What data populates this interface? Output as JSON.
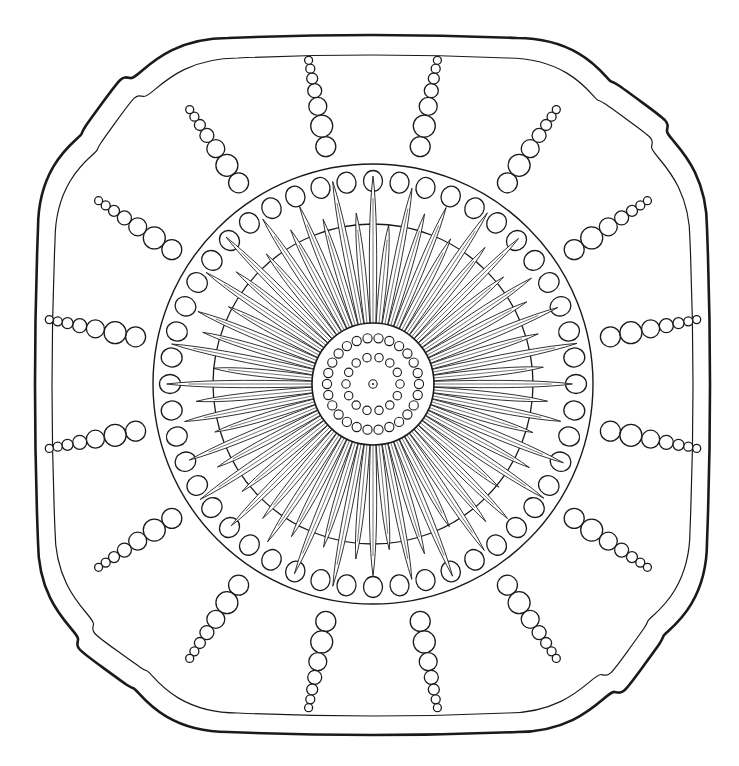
{
  "figure": {
    "title": "Decorative square dish with sunburst rosette and beaded rays"
  },
  "colors": {
    "background": "#ffffff",
    "ink": "#1a1a1a"
  },
  "canvas": {
    "width": 739,
    "height": 766
  },
  "center": {
    "x": 373,
    "y": 384
  },
  "plate": {
    "outer_rim": {
      "left": 38,
      "top": 38,
      "right": 707,
      "bottom": 732,
      "stroke_width": 2.6
    },
    "inner_rim": {
      "left": 55,
      "top": 58,
      "right": 690,
      "bottom": 713,
      "stroke_width": 1.2
    },
    "corner_scallop": true
  },
  "outer_band": {
    "circle_radius": 220,
    "bead_ring_radius": 203,
    "bead_count": 48,
    "bead_rx": 9.5,
    "bead_ry": 10.5
  },
  "inner_circle": {
    "radius": 160
  },
  "rays": {
    "count": 16,
    "angle_offset_deg": 11.25,
    "inner_radius": 232,
    "bead_radii": [
      10,
      11,
      9,
      7,
      5.5,
      4.5,
      4
    ]
  },
  "sunburst": {
    "long_petal_count": 32,
    "short_petal_count": 32,
    "long_length": 148,
    "short_length": 118,
    "base_radius": 60,
    "petal_half_width": 5.5
  },
  "rosette": {
    "disc_radius": 61,
    "outer_bead_ring": {
      "radius": 46,
      "count": 26,
      "bead_radius": 4.6
    },
    "inner_bead_ring": {
      "radius": 27,
      "count": 14,
      "bead_radius": 4.2
    },
    "center_dot": {
      "radius": 4.2,
      "pip_radius": 1.0
    }
  }
}
